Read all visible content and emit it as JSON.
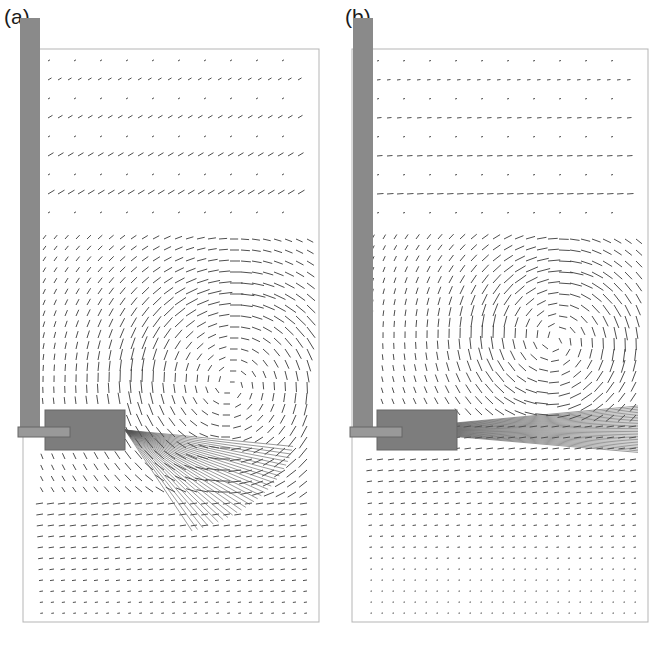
{
  "figure": {
    "panels": [
      {
        "id": "a",
        "label": "(a)",
        "box": {
          "x": 23,
          "y": 49,
          "w": 296,
          "h": 573
        },
        "electrode": {
          "x": 20,
          "y": 18,
          "w": 20,
          "h": 410
        },
        "nozzle": {
          "port_x": 18,
          "port_y": 427,
          "port_w": 52,
          "port_h": 10,
          "block_x": 45,
          "block_y": 410,
          "block_w": 80,
          "block_h": 40
        },
        "vortex": {
          "cx": 230,
          "cy": 385,
          "r": 95
        },
        "jet": "downward-spreading"
      },
      {
        "id": "b",
        "label": "(b)",
        "box": {
          "x": 352,
          "y": 49,
          "w": 296,
          "h": 573
        },
        "electrode": {
          "x": 353,
          "y": 18,
          "w": 20,
          "h": 410
        },
        "nozzle": {
          "port_x": 350,
          "port_y": 427,
          "port_w": 52,
          "port_h": 10,
          "block_x": 377,
          "block_y": 410,
          "block_w": 80,
          "block_h": 40
        },
        "vortex": {
          "cx": 555,
          "cy": 340,
          "r": 70
        },
        "jet": "horizontal"
      }
    ],
    "colors": {
      "frame": "#b5b5b5",
      "arrow": "#3a3a3a",
      "electrode": "#8a8a8a",
      "nozzle": "#7d7d7d",
      "jet": "#555555"
    }
  }
}
